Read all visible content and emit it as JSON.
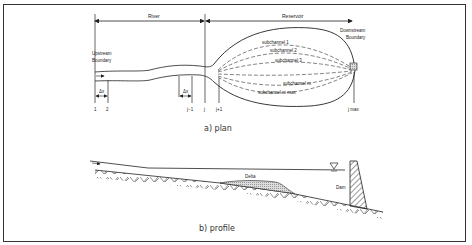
{
  "plan": {
    "caption": "a)  plan",
    "river_label": "River",
    "reservoir_label": "Reservoir",
    "upstream_label_1": "Upstream",
    "upstream_label_2": "Boundary",
    "downstream_label_1": "Downstream",
    "downstream_label_2": "Boundary",
    "dx_label": "Δx",
    "section_labels": [
      "1",
      "2",
      "j−1",
      "j",
      "j+1",
      "j max"
    ],
    "subchannels": [
      "subchannel  1",
      "subchannel  2",
      "subchannel  3",
      "subchannel  m",
      "subchannel  m max"
    ]
  },
  "profile": {
    "caption": "b)  profile",
    "delta_label": "Delta",
    "dam_label": "Dam"
  }
}
